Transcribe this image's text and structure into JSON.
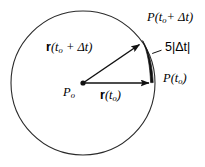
{
  "figure": {
    "background_color": "#ffffff",
    "stroke_color": "#1a1a1a",
    "circle": {
      "name": "circular-path",
      "center_x": 83,
      "center_y": 83,
      "radius": 72,
      "stroke_width": 1.1
    },
    "center_point": {
      "label_text": "P",
      "subscript": "o",
      "x": 83,
      "y": 83
    },
    "vectors": [
      {
        "name": "r-t0",
        "label_main": "r",
        "label_rest": "(t",
        "label_sub": "o",
        "label_tail": ")",
        "from_x": 83,
        "from_y": 83,
        "to_x": 153,
        "to_y": 83,
        "direction": "horizontal-right"
      },
      {
        "name": "r-t0-plus-dt",
        "label_main": "r",
        "label_rest": "(t",
        "label_sub": "o",
        "label_tail": " + Δt)",
        "from_x": 83,
        "from_y": 83,
        "to_x": 143,
        "to_y": 41,
        "direction": "diagonal-up-right"
      }
    ],
    "point_labels": [
      {
        "name": "point-p-t0-plus-dt",
        "prefix": "P(t",
        "subscript": "o",
        "suffix": "+ Δt)"
      },
      {
        "name": "point-p-t0",
        "prefix": "P(t",
        "subscript": "o",
        "suffix": ")"
      }
    ],
    "arc_annotation": {
      "name": "arc-length-annotation",
      "text": "5|Δt|",
      "description": "arc segment between P(t_o) and P(t_o + dt)"
    }
  }
}
